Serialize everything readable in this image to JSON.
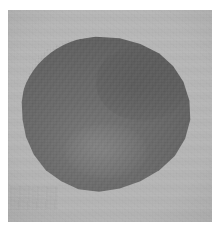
{
  "figure": {
    "kind": "grayscale-photograph",
    "caption": "",
    "label": "",
    "has_visible_text": false
  },
  "canvas": {
    "width": 223,
    "height": 232,
    "page_background": "#ffffff"
  },
  "panel": {
    "name": "photographic-plate",
    "left": 8,
    "top": 10,
    "width": 204,
    "height": 212,
    "background_color": "#b4b4b4",
    "background_color_light": "#bcbcbc",
    "background_color_dark": "#a9a9a9",
    "texture": "film-grain",
    "banding": "horizontal-scan-banding"
  },
  "specimen": {
    "name": "specimen-object",
    "left": 20,
    "top": 36,
    "width": 172,
    "height": 158,
    "fill_color": "#6b6b6b",
    "fill_color_light": "#787878",
    "fill_color_dark": "#5e5e5e",
    "shape": "rounded-polygonal",
    "edge": "soft-irregular",
    "surface": "granular"
  },
  "artifacts": {
    "smudge_label": "faint handling smudge",
    "smudge_left": 2,
    "smudge_top": 186
  }
}
